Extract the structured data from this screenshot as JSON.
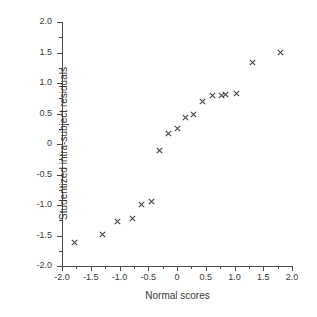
{
  "chart_data": {
    "type": "scatter",
    "title": "",
    "subtitle": "",
    "xlabel": "Normal scores",
    "ylabel": "Studentized intra-subject residuals",
    "xlim": [
      -2.0,
      2.0
    ],
    "ylim": [
      -2.0,
      2.0
    ],
    "grid": false,
    "legend": null,
    "marker": "x",
    "marker_color": "#4a4a4a",
    "xticks": [
      -2.0,
      -1.5,
      -1.0,
      -0.5,
      0,
      0.5,
      1.0,
      1.5,
      2.0
    ],
    "xtick_labels": [
      "-2.0",
      "-1.5",
      "-1.0",
      "-0.5",
      "0",
      "0.5",
      "1.0",
      "1.5",
      "2.0"
    ],
    "yticks": [
      2.0,
      1.5,
      1.0,
      0.5,
      0,
      -0.5,
      -1.0,
      -1.5,
      -2.0
    ],
    "ytick_labels": [
      "2.0",
      "1.5",
      "1.0",
      "0.5",
      "0",
      "-0.5",
      "-1.0",
      "-1.5",
      "-2.0"
    ],
    "minor_tick_step": 0.25,
    "x": [
      -1.79,
      -1.3,
      -1.04,
      -0.78,
      -0.62,
      -0.45,
      -0.3,
      -0.14,
      0.0,
      0.15,
      0.29,
      0.45,
      0.61,
      0.78,
      0.84,
      1.03,
      1.32,
      1.8
    ],
    "y": [
      -1.62,
      -1.48,
      -1.27,
      -1.22,
      -0.99,
      -0.94,
      -0.11,
      0.18,
      0.25,
      0.43,
      0.48,
      0.69,
      0.79,
      0.8,
      0.81,
      0.82,
      1.34,
      1.5
    ],
    "points": [
      {
        "x": -1.79,
        "y": -1.62
      },
      {
        "x": -1.3,
        "y": -1.48
      },
      {
        "x": -1.04,
        "y": -1.27
      },
      {
        "x": -0.78,
        "y": -1.22
      },
      {
        "x": -0.62,
        "y": -0.99
      },
      {
        "x": -0.45,
        "y": -0.94
      },
      {
        "x": -0.3,
        "y": -0.11
      },
      {
        "x": -0.14,
        "y": 0.18
      },
      {
        "x": 0.0,
        "y": 0.25
      },
      {
        "x": 0.15,
        "y": 0.43
      },
      {
        "x": 0.29,
        "y": 0.48
      },
      {
        "x": 0.45,
        "y": 0.69
      },
      {
        "x": 0.61,
        "y": 0.79
      },
      {
        "x": 0.78,
        "y": 0.8
      },
      {
        "x": 0.84,
        "y": 0.81
      },
      {
        "x": 1.03,
        "y": 0.82
      },
      {
        "x": 1.32,
        "y": 1.34
      },
      {
        "x": 1.8,
        "y": 1.5
      }
    ]
  }
}
